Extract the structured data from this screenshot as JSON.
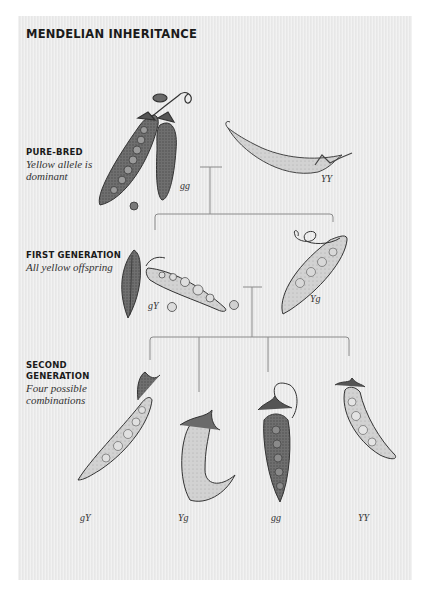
{
  "title": "MENDELIAN INHERITANCE",
  "sections": [
    {
      "heading": "PURE-BRED",
      "subtitle_lines": [
        "Yellow allele is",
        "dominant"
      ]
    },
    {
      "heading": "FIRST GENERATION",
      "subtitle_lines": [
        "All yellow offspring"
      ]
    },
    {
      "heading_lines": [
        "SECOND",
        "GENERATION"
      ],
      "subtitle_lines": [
        "Four possible",
        "combinations"
      ]
    }
  ],
  "pure_bred": {
    "left_genotype": "gg",
    "right_genotype": "YY"
  },
  "first_generation": {
    "left_genotype": "gY",
    "right_genotype": "Yg"
  },
  "second_generation": {
    "genotypes": [
      "gY",
      "Yg",
      "gg",
      "YY"
    ]
  },
  "colors": {
    "panel": "#ebebeb",
    "line": "#8a8a8a",
    "ink": "#3a3a3a",
    "green_pod": "#6e6e6e",
    "yellow_pod": "#cfcfcf"
  }
}
